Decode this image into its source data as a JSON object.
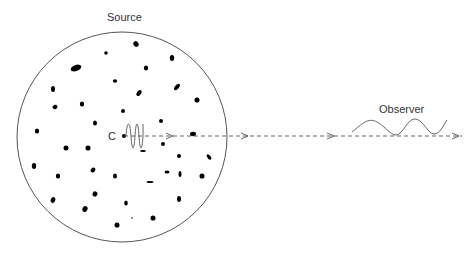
{
  "labels": {
    "source": "Source",
    "observer": "Observer",
    "center": "C"
  },
  "colors": {
    "stroke": "#555555",
    "blob": "#000000",
    "text": "#333333"
  },
  "source_circle": {
    "cx": 122,
    "cy": 137,
    "r": 105
  },
  "beam": {
    "y": 136,
    "x_start": 124,
    "x_end": 462,
    "arrowheads_x": [
      172,
      247,
      333,
      458
    ]
  },
  "blobs": [
    [
      136,
      44,
      2.5,
      3,
      -30
    ],
    [
      106,
      53,
      1.8,
      1.8,
      0
    ],
    [
      76,
      68,
      5.5,
      3,
      -20
    ],
    [
      146,
      68,
      2.2,
      2.6,
      0
    ],
    [
      172,
      58,
      2.2,
      3,
      0
    ],
    [
      115,
      81,
      2.2,
      1.8,
      0
    ],
    [
      139,
      93,
      2,
      3.4,
      35
    ],
    [
      177,
      87,
      2,
      3.8,
      40
    ],
    [
      53,
      89,
      2,
      3,
      0
    ],
    [
      197,
      100,
      2.5,
      2.6,
      0
    ],
    [
      55,
      107,
      2.5,
      2.2,
      -20
    ],
    [
      82,
      104,
      2.2,
      2.6,
      0
    ],
    [
      123,
      111,
      2,
      2,
      0
    ],
    [
      161,
      121,
      2,
      2,
      0
    ],
    [
      95,
      123,
      2,
      2.6,
      0
    ],
    [
      37,
      131,
      2.2,
      2.6,
      0
    ],
    [
      124,
      136,
      2,
      2,
      0
    ],
    [
      193,
      134,
      3,
      2.2,
      0
    ],
    [
      163,
      144,
      2,
      2,
      0
    ],
    [
      143,
      151,
      3,
      1,
      0
    ],
    [
      66,
      148,
      2.5,
      2.5,
      0
    ],
    [
      88,
      148,
      2.5,
      2.6,
      0
    ],
    [
      179,
      156,
      2,
      2,
      0
    ],
    [
      209,
      157,
      1.6,
      3.2,
      -35
    ],
    [
      34,
      166,
      2.2,
      3,
      0
    ],
    [
      58,
      176,
      2.2,
      2.6,
      0
    ],
    [
      93,
      170,
      2.2,
      2.6,
      30
    ],
    [
      167,
      172,
      2.5,
      1.6,
      0
    ],
    [
      180,
      174,
      1.5,
      3,
      0
    ],
    [
      115,
      176,
      2,
      2.6,
      0
    ],
    [
      150,
      182,
      3.5,
      1,
      0
    ],
    [
      202,
      176,
      2.5,
      2.6,
      0
    ],
    [
      95,
      194,
      2.4,
      2.6,
      30
    ],
    [
      53,
      200,
      2.2,
      3,
      20
    ],
    [
      179,
      199,
      2,
      3,
      0
    ],
    [
      126,
      203,
      1.8,
      2.6,
      0
    ],
    [
      85,
      209,
      2.5,
      3,
      25
    ],
    [
      153,
      218,
      2.5,
      2.6,
      0
    ],
    [
      132,
      218,
      0.8,
      0.8,
      0
    ],
    [
      117,
      225,
      2.5,
      2.6,
      0
    ]
  ]
}
